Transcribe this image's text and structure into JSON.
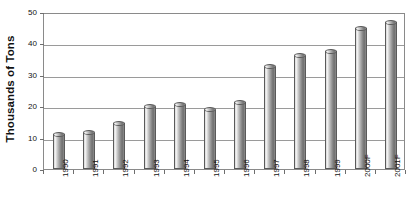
{
  "chart_data": {
    "type": "bar",
    "title": "",
    "subtitle": "",
    "xlabel": "",
    "ylabel": "Thousands of Tons",
    "ylim": [
      0,
      50
    ],
    "yticks": [
      0,
      10,
      20,
      30,
      40,
      50
    ],
    "ytick_labels": [
      "0",
      "10",
      "20",
      "30",
      "40",
      "50"
    ],
    "grid": true,
    "legend": null,
    "categories": [
      "1990",
      "1991",
      "1992",
      "1993",
      "1994",
      "1995",
      "1996",
      "1997",
      "1998",
      "1999",
      "2000F",
      "2001F"
    ],
    "values": [
      11.0,
      11.5,
      14.5,
      19.8,
      20.5,
      18.8,
      21.3,
      32.5,
      36.0,
      37.5,
      44.8,
      46.7
    ],
    "series": [
      {
        "name": "",
        "values": [
          11.0,
          11.5,
          14.5,
          19.8,
          20.5,
          18.8,
          21.3,
          32.5,
          36.0,
          37.5,
          44.8,
          46.7
        ]
      }
    ],
    "bar_style": "cylinder",
    "colors": {
      "bar_light": "#f2f2f2",
      "bar_mid": "#bdbdbd",
      "bar_dark": "#6f6f6f",
      "bar_outline": "#5a5a5a",
      "gridline": "#9a9a9a",
      "axis": "#8a8a8a",
      "text": "#111111",
      "background": "#ffffff"
    }
  }
}
